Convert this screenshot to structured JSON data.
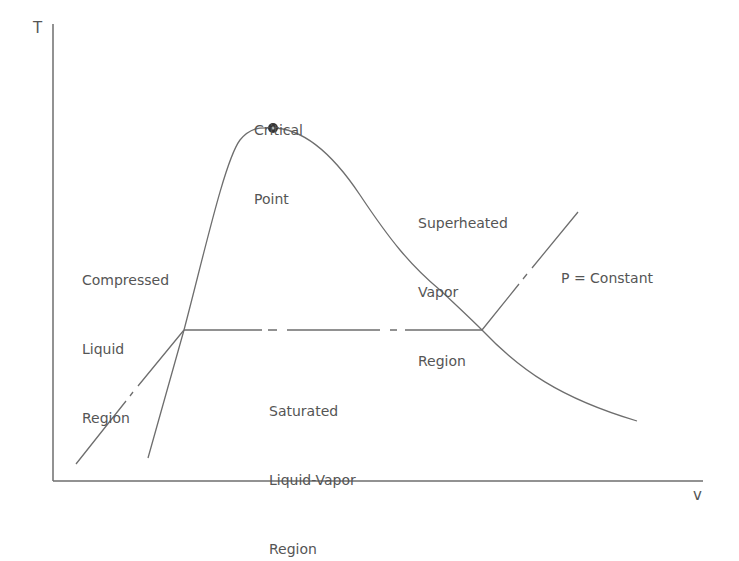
{
  "diagram": {
    "axes": {
      "y_label": "T",
      "x_label": "v"
    },
    "labels": {
      "critical_point": [
        "Critical",
        "Point"
      ],
      "compressed_liquid": [
        "Compressed",
        "Liquid",
        "Region"
      ],
      "superheated_vapor": [
        "Superheated",
        "Vapor",
        "Region"
      ],
      "saturated_mixture": [
        "Saturated",
        "Liquid-Vapor",
        "Region"
      ],
      "isobar": "P = Constant"
    },
    "colors": {
      "line": "#6e6e6e",
      "text": "#555555",
      "point": "#333333"
    }
  }
}
